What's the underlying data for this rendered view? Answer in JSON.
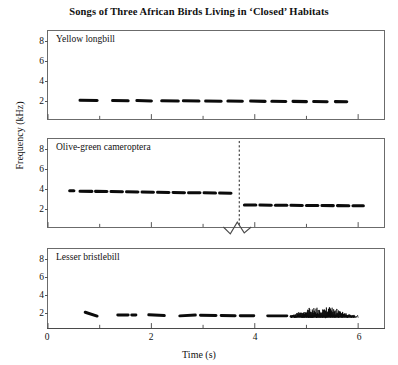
{
  "figure": {
    "title": "Songs of Three African Birds Living in ‘Closed’ Habitats",
    "xlabel": "Time (s)",
    "ylabel": "Frequency (kHz)"
  },
  "axes": {
    "y_ticks": [
      "2",
      "4",
      "6",
      "8"
    ],
    "x_ticks": [
      "0",
      "2",
      "4",
      "6"
    ]
  },
  "panels": [
    {
      "label": "Yellow longbill"
    },
    {
      "label": "Olive-green cameroptera"
    },
    {
      "label": "Lesser bristlebill"
    }
  ],
  "chart_data": {
    "type": "line",
    "title": "Songs of Three African Birds Living in ‘Closed’ Habitats",
    "xlabel": "Time (s)",
    "ylabel": "Frequency (kHz)",
    "xlim": [
      0,
      6.5
    ],
    "ylim": [
      0,
      9
    ],
    "x_ticks": [
      0,
      2,
      4,
      6
    ],
    "x_minor_ticks": [
      1,
      3,
      5
    ],
    "y_ticks": [
      2,
      4,
      6,
      8
    ],
    "grid": false,
    "legend": "none",
    "panels": [
      {
        "name": "Yellow longbill",
        "description": "Series of short level notes near 2 kHz, repeated from about 0.6 s to 5.8 s",
        "note_frequency_khz": 2.1,
        "notes": [
          {
            "t_start": 0.62,
            "t_end": 0.95,
            "f_start": 2.15,
            "f_end": 2.12
          },
          {
            "t_start": 1.25,
            "t_end": 1.55,
            "f_start": 2.12,
            "f_end": 2.1
          },
          {
            "t_start": 1.72,
            "t_end": 2.0,
            "f_start": 2.12,
            "f_end": 2.08
          },
          {
            "t_start": 2.2,
            "t_end": 2.52,
            "f_start": 2.1,
            "f_end": 2.08
          },
          {
            "t_start": 2.62,
            "t_end": 2.92,
            "f_start": 2.1,
            "f_end": 2.06
          },
          {
            "t_start": 3.05,
            "t_end": 3.35,
            "f_start": 2.08,
            "f_end": 2.05
          },
          {
            "t_start": 3.48,
            "t_end": 3.76,
            "f_start": 2.06,
            "f_end": 2.04
          },
          {
            "t_start": 3.92,
            "t_end": 4.2,
            "f_start": 2.06,
            "f_end": 2.03
          },
          {
            "t_start": 4.33,
            "t_end": 4.6,
            "f_start": 2.04,
            "f_end": 2.02
          },
          {
            "t_start": 4.74,
            "t_end": 5.0,
            "f_start": 2.03,
            "f_end": 2.0
          },
          {
            "t_start": 5.14,
            "t_end": 5.4,
            "f_start": 2.02,
            "f_end": 1.99
          },
          {
            "t_start": 5.56,
            "t_end": 5.78,
            "f_start": 2.0,
            "f_end": 1.98
          }
        ]
      },
      {
        "name": "Olive-green cameroptera",
        "description": "Repeated notes near 4 kHz that step down to about 2.5 kHz after a marked transition at 3.7 s",
        "transition_time_s": 3.7,
        "frequency_before_khz": 4.0,
        "frequency_after_khz": 2.5,
        "has_axis_break": true,
        "notes": [
          {
            "t_start": 0.42,
            "t_end": 0.5,
            "f_start": 4.18,
            "f_end": 4.18
          },
          {
            "t_start": 0.62,
            "t_end": 0.85,
            "f_start": 4.12,
            "f_end": 4.1
          },
          {
            "t_start": 0.92,
            "t_end": 1.14,
            "f_start": 4.1,
            "f_end": 4.08
          },
          {
            "t_start": 1.22,
            "t_end": 1.44,
            "f_start": 4.08,
            "f_end": 4.05
          },
          {
            "t_start": 1.52,
            "t_end": 1.74,
            "f_start": 4.05,
            "f_end": 4.02
          },
          {
            "t_start": 1.82,
            "t_end": 2.04,
            "f_start": 4.02,
            "f_end": 4.0
          },
          {
            "t_start": 2.12,
            "t_end": 2.34,
            "f_start": 4.0,
            "f_end": 3.98
          },
          {
            "t_start": 2.42,
            "t_end": 2.64,
            "f_start": 3.98,
            "f_end": 3.95
          },
          {
            "t_start": 2.72,
            "t_end": 2.94,
            "f_start": 3.95,
            "f_end": 3.93
          },
          {
            "t_start": 3.02,
            "t_end": 3.24,
            "f_start": 3.93,
            "f_end": 3.9
          },
          {
            "t_start": 3.32,
            "t_end": 3.54,
            "f_start": 3.9,
            "f_end": 3.88
          },
          {
            "t_start": 3.8,
            "t_end": 4.02,
            "f_start": 2.52,
            "f_end": 2.52
          },
          {
            "t_start": 4.1,
            "t_end": 4.32,
            "f_start": 2.52,
            "f_end": 2.5
          },
          {
            "t_start": 4.4,
            "t_end": 4.62,
            "f_start": 2.5,
            "f_end": 2.5
          },
          {
            "t_start": 4.7,
            "t_end": 4.92,
            "f_start": 2.5,
            "f_end": 2.48
          },
          {
            "t_start": 5.0,
            "t_end": 5.22,
            "f_start": 2.48,
            "f_end": 2.48
          },
          {
            "t_start": 5.3,
            "t_end": 5.52,
            "f_start": 2.48,
            "f_end": 2.46
          },
          {
            "t_start": 5.6,
            "t_end": 5.82,
            "f_start": 2.46,
            "f_end": 2.45
          },
          {
            "t_start": 5.9,
            "t_end": 6.1,
            "f_start": 2.45,
            "f_end": 2.45
          }
        ]
      },
      {
        "name": "Lesser bristlebill",
        "description": "Low level notes near 1.6 kHz followed by a rapid broadband trill burst from about 4.7 s to 6.0 s reaching 3 kHz",
        "note_frequency_khz": 1.6,
        "trill_start_s": 4.7,
        "trill_end_s": 6.0,
        "trill_peak_khz": 3.0,
        "notes": [
          {
            "t_start": 0.72,
            "t_end": 0.95,
            "f_start": 2.05,
            "f_end": 1.55
          },
          {
            "t_start": 1.35,
            "t_end": 1.55,
            "f_start": 1.7,
            "f_end": 1.7
          },
          {
            "t_start": 1.62,
            "t_end": 1.7,
            "f_start": 1.68,
            "f_end": 1.68
          },
          {
            "t_start": 1.95,
            "t_end": 2.25,
            "f_start": 1.72,
            "f_end": 1.62
          },
          {
            "t_start": 2.55,
            "t_end": 2.85,
            "f_start": 1.58,
            "f_end": 1.68
          },
          {
            "t_start": 2.95,
            "t_end": 3.25,
            "f_start": 1.66,
            "f_end": 1.62
          },
          {
            "t_start": 3.35,
            "t_end": 3.62,
            "f_start": 1.62,
            "f_end": 1.6
          },
          {
            "t_start": 3.72,
            "t_end": 3.98,
            "f_start": 1.6,
            "f_end": 1.6
          },
          {
            "t_start": 4.25,
            "t_end": 4.62,
            "f_start": 1.58,
            "f_end": 1.58
          }
        ]
      }
    ]
  }
}
